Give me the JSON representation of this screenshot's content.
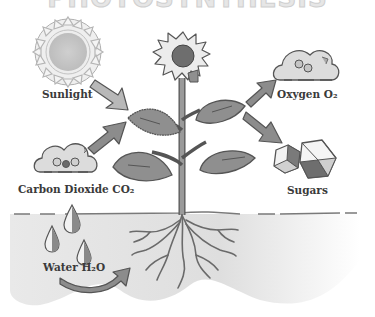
{
  "title": "PHOTOSYNTHESIS",
  "labels": {
    "sunlight": "Sunlight",
    "oxygen": "Oxygen O₂",
    "carbon_dioxide": "Carbon Dioxide CO₂",
    "sugars": "Sugars",
    "water": "Water H₂O"
  },
  "colors": {
    "background": "#ffffff",
    "soil": "#e4e4e4",
    "outline": "#555555",
    "leaf": "#8f8f8f",
    "arrow": "#8a8a8a",
    "arrow_light": "#b5b5b5",
    "sun": "#c8c8c8",
    "text": "#3a3a3a"
  }
}
